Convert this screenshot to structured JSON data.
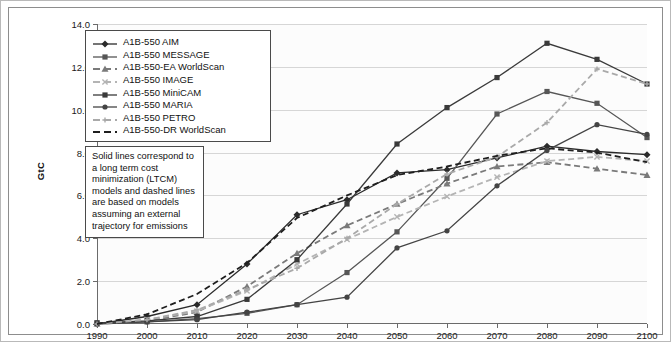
{
  "chart_data": {
    "type": "line",
    "title": "",
    "xlabel": "",
    "ylabel": "GtC",
    "xticks": [
      1990,
      2000,
      2010,
      2020,
      2030,
      2040,
      2050,
      2060,
      2070,
      2080,
      2090,
      2100
    ],
    "yticks": [
      "0.0",
      "2.0",
      "4.0",
      "6.0",
      "8.0",
      "10.0",
      "12.0",
      "14.0"
    ],
    "xlim": [
      1990,
      2100
    ],
    "ylim": [
      0.0,
      14.0
    ],
    "grid": "horizontal",
    "legend_position": "top-left",
    "x": [
      1990,
      2000,
      2010,
      2020,
      2030,
      2040,
      2050,
      2060,
      2070,
      2080,
      2090,
      2100
    ],
    "series": [
      {
        "name": "A1B-550 AIM",
        "marker": "diamond",
        "style": "solid",
        "color": "#2b2b2b",
        "values": [
          0.0,
          0.35,
          0.9,
          2.8,
          5.1,
          5.8,
          7.05,
          7.2,
          7.75,
          8.3,
          8.05,
          7.9
        ]
      },
      {
        "name": "A1B-550 MESSAGE",
        "marker": "square",
        "style": "solid",
        "color": "#565656",
        "values": [
          0.05,
          0.1,
          0.25,
          0.5,
          0.9,
          2.4,
          4.3,
          6.8,
          9.8,
          10.85,
          10.3,
          8.7
        ]
      },
      {
        "name": "A1B-550-EA WorldScan",
        "marker": "triangle",
        "style": "dashed",
        "color": "#7a7a7a",
        "values": [
          0.0,
          0.15,
          0.55,
          1.75,
          3.3,
          4.6,
          5.6,
          6.55,
          7.35,
          7.55,
          7.25,
          6.95
        ]
      },
      {
        "name": "A1B-550 IMAGE",
        "marker": "x",
        "style": "dashed",
        "color": "#b4b4b4",
        "values": [
          0.0,
          0.2,
          0.6,
          1.55,
          2.8,
          3.95,
          5.0,
          5.95,
          6.85,
          7.6,
          7.8,
          7.6
        ]
      },
      {
        "name": "A1B-550 MiniCAM",
        "marker": "square",
        "style": "solid",
        "color": "#3a3a3a",
        "values": [
          0.05,
          0.15,
          0.35,
          1.15,
          3.0,
          5.6,
          8.4,
          10.1,
          11.5,
          13.1,
          12.35,
          11.2
        ]
      },
      {
        "name": "A1B-550 MARIA",
        "marker": "circle",
        "style": "solid",
        "color": "#444444",
        "values": [
          0.0,
          0.1,
          0.2,
          0.55,
          0.9,
          1.25,
          3.55,
          4.35,
          6.45,
          8.1,
          9.3,
          8.85
        ]
      },
      {
        "name": "A1B-550 PETRO",
        "marker": "plus",
        "style": "dashed",
        "color": "#a9a9a9",
        "values": [
          0.0,
          0.2,
          0.65,
          1.6,
          2.6,
          4.0,
          5.6,
          7.0,
          7.8,
          9.4,
          11.9,
          11.2
        ]
      },
      {
        "name": "A1B-550-DR WorldScan",
        "marker": "none",
        "style": "dashed",
        "color": "#1f1f1f",
        "values": [
          0.0,
          0.45,
          1.4,
          2.85,
          4.95,
          6.0,
          6.95,
          7.35,
          7.85,
          8.2,
          8.0,
          7.55
        ]
      }
    ],
    "annotation": "Solid lines correspond to a long term cost minimization (LTCM) models and dashed lines are based on models assuming an external trajectory for emissions"
  }
}
